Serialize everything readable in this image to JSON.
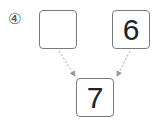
{
  "problem": {
    "number_label": "④",
    "boxes": {
      "left": "",
      "right": "6",
      "bottom": "7"
    }
  },
  "colors": {
    "border": "#7a7a7a",
    "arrow": "#9a9a9a",
    "text": "#222222"
  }
}
